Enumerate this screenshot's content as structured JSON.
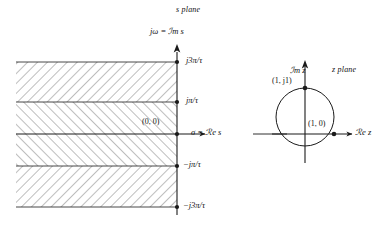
{
  "figure": {
    "type": "s-plane to z-plane mapping diagram",
    "planes": [
      {
        "id": "s-plane",
        "title": "s plane",
        "imag_axis_label": "jω = ℐm s",
        "real_axis_label": "σ = ℛe s",
        "origin_label": "(0, 0)",
        "tick_labels": [
          "j3π/τ",
          "jπ/τ",
          "−jπ/τ",
          "−j3π/τ"
        ],
        "shaded_strips": 3,
        "shading": "diagonal hatching"
      },
      {
        "id": "z-plane",
        "title": "z plane",
        "imag_axis_label": "ℐm z",
        "real_axis_label": "ℛe z",
        "point_labels": [
          "(1, j1)",
          "(1, 0)"
        ],
        "curve": "unit circle"
      }
    ]
  },
  "labels": {
    "s_plane_title": "s plane",
    "s_imag_axis": "jω = ℐm s",
    "s_real_axis": "σ = ℛe s",
    "s_origin": "(0, 0)",
    "tick_j3pi": "j3π/τ",
    "tick_jpi": "jπ/τ",
    "tick_neg_jpi": "−jπ/τ",
    "tick_neg_j3pi": "−j3π/τ",
    "z_plane_title": "z plane",
    "z_imag_axis": "ℐm z",
    "z_real_axis": "ℛe z",
    "z_point_top": "(1, j1)",
    "z_point_right": "(1, 0)"
  },
  "colors": {
    "stroke": "#1a1a1a",
    "hatch": "#6e6e6e",
    "background": "#ffffff"
  }
}
